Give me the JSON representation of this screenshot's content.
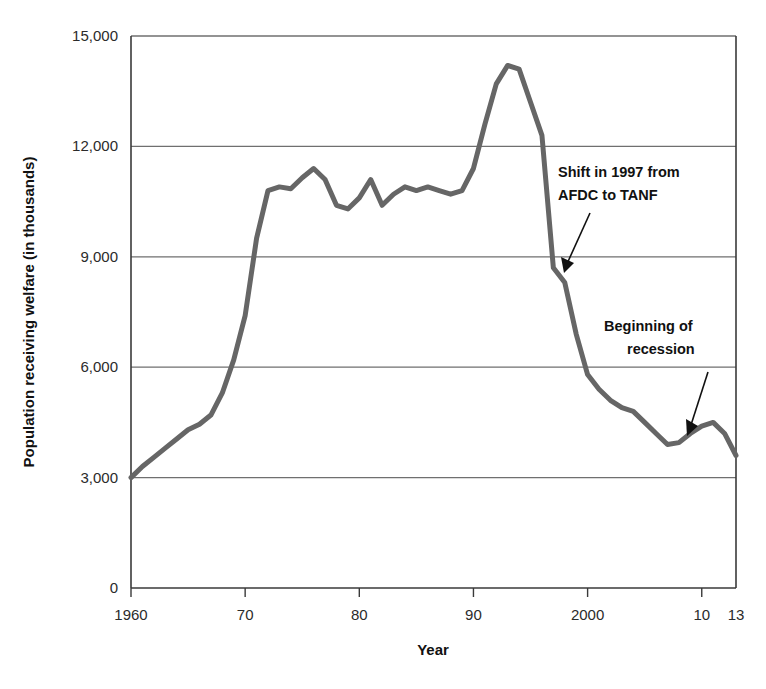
{
  "chart_data": {
    "type": "line",
    "title": "",
    "xlabel": "Year",
    "ylabel": "Population receiving welfare (in thousands)",
    "xlim": [
      1960,
      2013
    ],
    "ylim": [
      0,
      15000
    ],
    "grid": true,
    "legend_position": "none",
    "line_color": "#666666",
    "y_ticks": [
      0,
      3000,
      6000,
      9000,
      12000,
      15000
    ],
    "y_tick_labels": [
      "0",
      "3,000",
      "6,000",
      "9,000",
      "12,000",
      "15,000"
    ],
    "x_ticks": [
      1960,
      1970,
      1980,
      1990,
      2000,
      2010,
      2013
    ],
    "x_tick_labels": [
      "1960",
      "70",
      "80",
      "90",
      "2000",
      "10",
      "13"
    ],
    "series": [
      {
        "name": "Population receiving welfare",
        "x": [
          1960,
          1961,
          1962,
          1963,
          1964,
          1965,
          1966,
          1967,
          1968,
          1969,
          1970,
          1971,
          1972,
          1973,
          1974,
          1975,
          1976,
          1977,
          1978,
          1979,
          1980,
          1981,
          1982,
          1983,
          1984,
          1985,
          1986,
          1987,
          1988,
          1989,
          1990,
          1991,
          1992,
          1993,
          1994,
          1995,
          1996,
          1997,
          1998,
          1999,
          2000,
          2001,
          2002,
          2003,
          2004,
          2005,
          2006,
          2007,
          2008,
          2009,
          2010,
          2011,
          2012,
          2013
        ],
        "values": [
          3000,
          3300,
          3550,
          3800,
          4050,
          4300,
          4450,
          4700,
          5300,
          6200,
          7400,
          9500,
          10800,
          10900,
          10850,
          11150,
          11400,
          11100,
          10400,
          10300,
          10600,
          11100,
          10400,
          10700,
          10900,
          10800,
          10900,
          10800,
          10700,
          10800,
          11400,
          12600,
          13700,
          14200,
          14100,
          13200,
          12300,
          8700,
          8300,
          6900,
          5800,
          5400,
          5100,
          4900,
          4800,
          4500,
          4200,
          3900,
          3950,
          4200,
          4400,
          4500,
          4200,
          3600
        ]
      }
    ],
    "annotations": [
      {
        "id": "afdc-tanf",
        "text_lines": [
          "Shift in 1997 from",
          "AFDC to TANF"
        ],
        "points_to_year": 1997,
        "points_to_value": 8700
      },
      {
        "id": "recession",
        "text_lines": [
          "Beginning of",
          "recession"
        ],
        "points_to_year": 2007,
        "points_to_value": 3900
      }
    ]
  }
}
